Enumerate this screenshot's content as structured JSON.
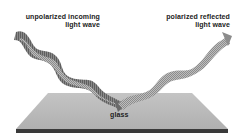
{
  "diagram": {
    "labels": {
      "incoming_line1": "unpolarized incoming",
      "incoming_line2": "light wave",
      "reflected_line1": "polarized reflected",
      "reflected_line2": "light wave",
      "surface": "glass"
    },
    "colors": {
      "background": "#ffffff",
      "glass_top": "#b8b8b8",
      "glass_edge": "#3a3a3a",
      "wave_dark": "#6e6e6e",
      "wave_light": "#a8a8a8",
      "text": "#222222"
    },
    "elements": [
      {
        "name": "incoming-wave",
        "kind": "arrow-band",
        "direction": "down-right",
        "from": "top-left",
        "to": "glass-center"
      },
      {
        "name": "reflected-wave",
        "kind": "arrow-band",
        "direction": "up-right",
        "from": "glass-center",
        "to": "top-right"
      },
      {
        "name": "glass-plate",
        "kind": "trapezoid-slab"
      }
    ]
  }
}
